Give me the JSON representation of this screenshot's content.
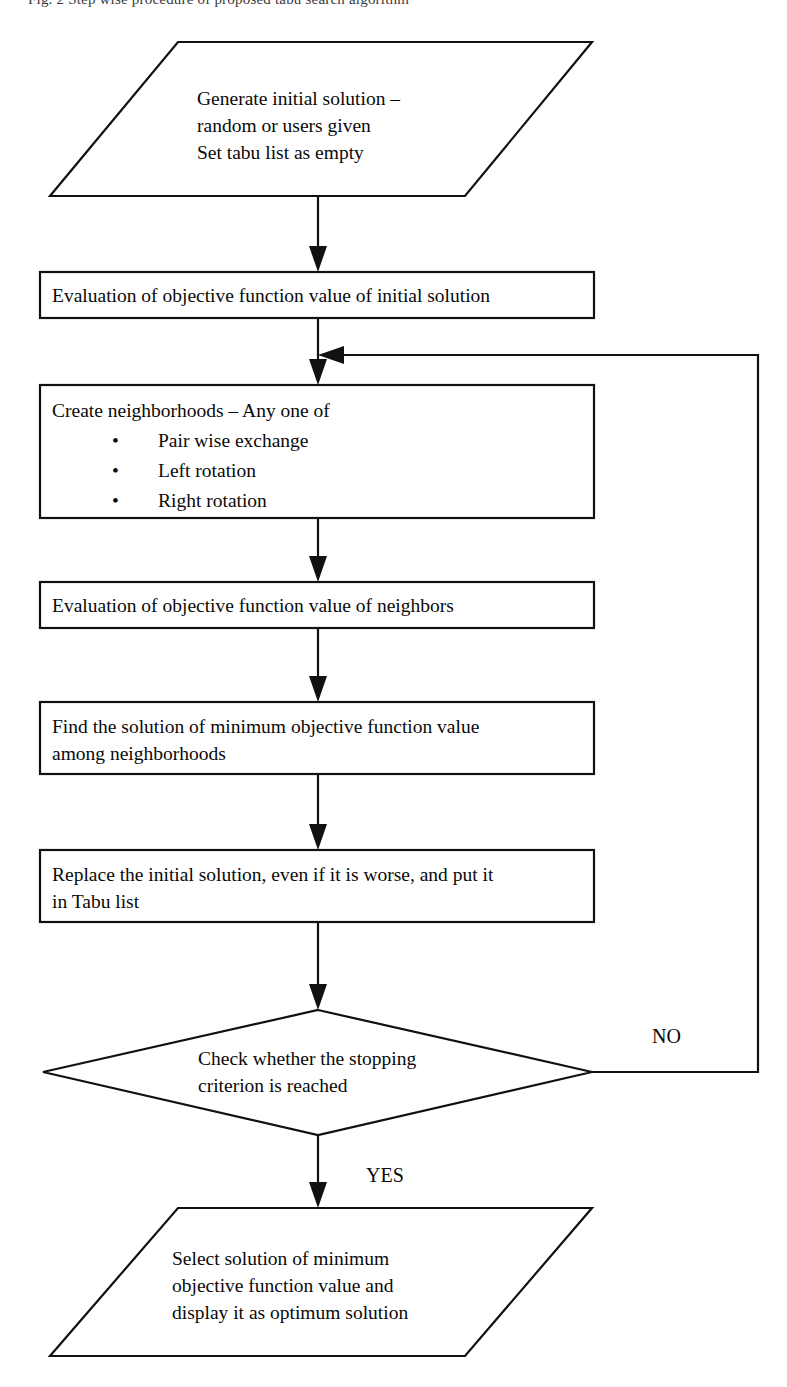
{
  "figure": {
    "caption_partial": "Fig. 2 Step wise procedure of proposed tabu search algorithm"
  },
  "nodes": {
    "start": {
      "shape": "parallelogram",
      "lines": [
        "Generate initial solution –",
        "random or users given",
        "Set tabu list as empty"
      ]
    },
    "eval_initial": {
      "shape": "rectangle",
      "lines": [
        "Evaluation of objective function value of initial solution"
      ]
    },
    "create_neighborhoods": {
      "shape": "rectangle",
      "heading": "Create neighborhoods – Any one of",
      "bullet_glyph": "•",
      "bullets": [
        "Pair wise exchange",
        "Left rotation",
        "Right rotation"
      ]
    },
    "eval_neighbors": {
      "shape": "rectangle",
      "lines": [
        "Evaluation of objective function value of neighbors"
      ]
    },
    "find_min": {
      "shape": "rectangle",
      "lines": [
        "Find the solution of minimum objective function value",
        "among neighborhoods"
      ]
    },
    "replace": {
      "shape": "rectangle",
      "lines": [
        "Replace the initial solution, even if it is worse, and put it",
        "in Tabu list"
      ]
    },
    "decision": {
      "shape": "diamond",
      "lines": [
        "Check whether the stopping",
        "criterion is reached"
      ]
    },
    "end": {
      "shape": "parallelogram",
      "lines": [
        "Select solution of minimum",
        "objective function value and",
        "display it as optimum solution"
      ]
    }
  },
  "branches": {
    "no_label": "NO",
    "yes_label": "YES"
  },
  "colors": {
    "stroke": "#111111",
    "fill": "#ffffff",
    "text": "#0a0a0a"
  }
}
